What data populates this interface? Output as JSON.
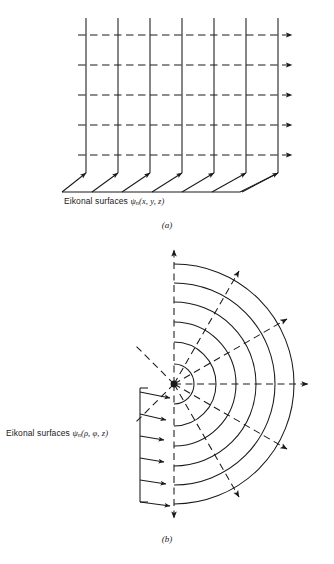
{
  "figure": {
    "type": "diagram",
    "background_color": "#ffffff",
    "line_color": "#1a1a1a"
  },
  "panel_a": {
    "caption": "(a)",
    "label_prefix": "Eikonal surfaces",
    "label_symbol": "ψ",
    "label_subscript": "n",
    "label_args": "(x, y, z)",
    "label_full": "Eikonal surfaces ψn(x, y, z)",
    "surface_count": 7,
    "ray_count": 5,
    "perspective_arrow_count": 7,
    "surface_style": "solid",
    "ray_style": "dashed",
    "geometry": "planar",
    "ray_direction": "left-to-right"
  },
  "panel_b": {
    "caption": "(b)",
    "label_prefix": "Eikonal surfaces",
    "label_symbol": "ψ",
    "label_subscript": "n",
    "label_args": "(ρ, φ, z)",
    "label_full": "Eikonal surfaces ψn(ρ, φ, z)",
    "arc_count": 6,
    "radial_ray_count": 9,
    "collimated_arrow_count": 6,
    "surface_style": "solid",
    "ray_style": "dashed",
    "geometry": "cylindrical",
    "source": "point-source-at-origin",
    "ray_direction": "radially-outward"
  },
  "bottom_caption": {
    "text": "",
    "state": "cropped"
  }
}
